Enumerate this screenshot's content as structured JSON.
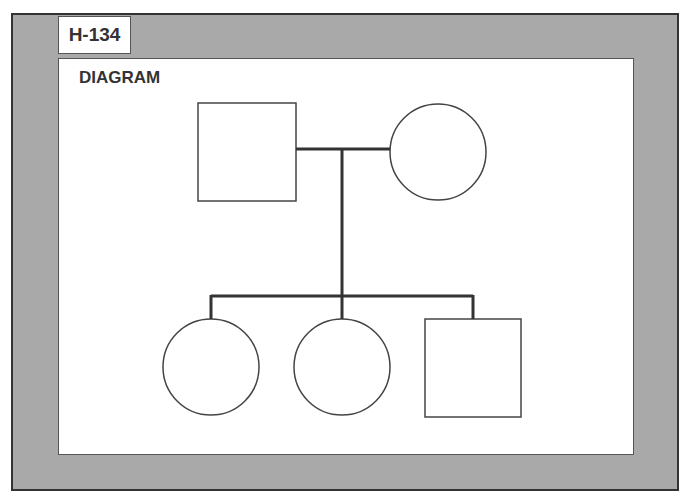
{
  "tag": {
    "label": "H-134"
  },
  "panel": {
    "title": "DIAGRAM"
  },
  "diagram": {
    "type": "pedigree",
    "parents": [
      {
        "shape": "square",
        "meaning": "male"
      },
      {
        "shape": "circle",
        "meaning": "female"
      }
    ],
    "children": [
      {
        "shape": "circle",
        "meaning": "female"
      },
      {
        "shape": "circle",
        "meaning": "female"
      },
      {
        "shape": "square",
        "meaning": "male"
      }
    ],
    "colors": {
      "frame": "#a9a9a9",
      "line": "#333333",
      "panel": "#ffffff"
    }
  }
}
